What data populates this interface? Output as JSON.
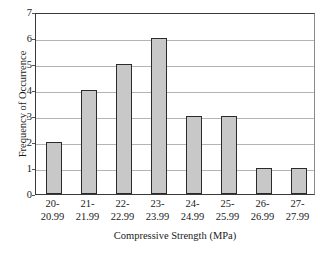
{
  "chart_data": {
    "type": "bar",
    "title": "",
    "subtitle": "",
    "xlabel": "Compressive Strength (MPa)",
    "ylabel": "Frequency of Occurrence",
    "categories": [
      "20-\n20.99",
      "21-\n21.99",
      "22-\n22.99",
      "23-\n23.99",
      "24-\n24.99",
      "25-\n25.99",
      "26-\n26.99",
      "27-\n27.99"
    ],
    "category_lines": [
      [
        "20-",
        "20.99"
      ],
      [
        "21-",
        "21.99"
      ],
      [
        "22-",
        "22.99"
      ],
      [
        "23-",
        "23.99"
      ],
      [
        "24-",
        "24.99"
      ],
      [
        "25-",
        "25.99"
      ],
      [
        "26-",
        "26.99"
      ],
      [
        "27-",
        "27.99"
      ]
    ],
    "values": [
      2,
      4,
      5,
      6,
      3,
      3,
      1,
      1
    ],
    "ylim": [
      0,
      7
    ],
    "ytick_values": [
      0,
      1,
      2,
      3,
      4,
      5,
      6,
      7
    ],
    "ytick_labels": [
      "0",
      "1",
      "2",
      "3",
      "4",
      "5",
      "6",
      "7"
    ],
    "grid": "horizontal",
    "legend": "none",
    "annotations": [],
    "colors": {
      "bar_fill": "#c8c8c8",
      "bar_edge": "#2b2b2b",
      "gridline": "#b4b4b4",
      "axis": "#3a3a3a",
      "text": "#1a1a1a",
      "background": "#ffffff"
    }
  }
}
